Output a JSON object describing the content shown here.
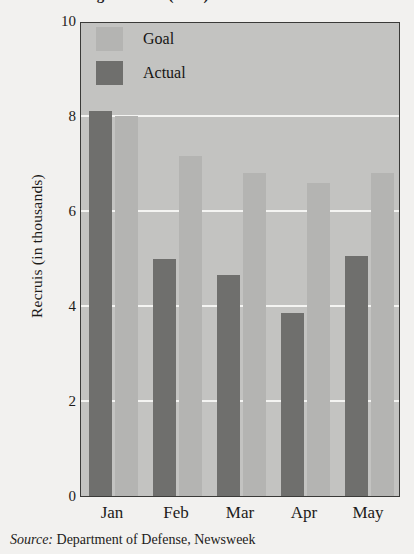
{
  "figure": {
    "title_cropped": "Recruiting Shortfall (2005)",
    "source_label": "Source:",
    "source_text": "Department of Defense, Newsweek"
  },
  "legend": {
    "position": "inside-top-center",
    "entries": [
      {
        "label": "Goal",
        "color": "#b4b4b2"
      },
      {
        "label": "Actual",
        "color": "#6f6f6d"
      }
    ]
  },
  "chart_data": {
    "type": "bar",
    "title": "Recruiting Shortfall (2005)",
    "xlabel": "",
    "ylabel": "Recruis (in thousands)",
    "categories": [
      "Jan",
      "Feb",
      "Mar",
      "Apr",
      "May"
    ],
    "series": [
      {
        "name": "Goal",
        "color": "#b4b4b2",
        "values": [
          8.0,
          7.15,
          6.8,
          6.6,
          6.8
        ]
      },
      {
        "name": "Actual",
        "color": "#6f6f6d",
        "values": [
          8.1,
          5.0,
          4.65,
          3.85,
          5.05
        ]
      }
    ],
    "ylim": [
      0,
      10
    ],
    "yticks": [
      0,
      2,
      4,
      6,
      8,
      10
    ],
    "ytick_labels": [
      "0",
      "2",
      "4",
      "6",
      "8",
      "10"
    ],
    "grid": "horizontal-white",
    "legend_entries": [
      "Goal",
      "Actual"
    ],
    "plot_background": "#c3c3c1",
    "annotations": []
  }
}
